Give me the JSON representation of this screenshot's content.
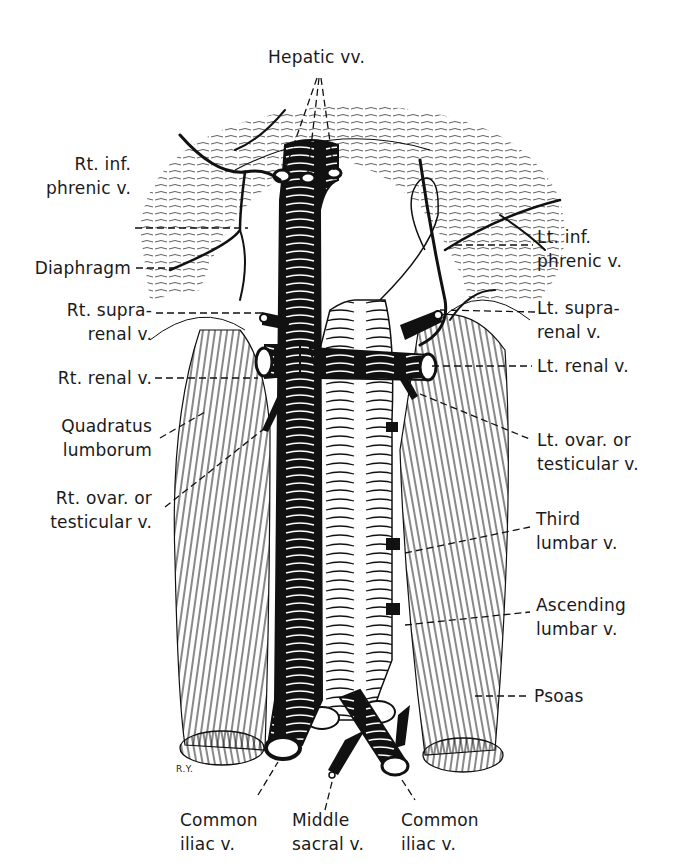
{
  "figure": {
    "artist_initials": "R.Y.",
    "colors": {
      "ink": "#111111",
      "paper": "#ffffff"
    }
  },
  "labels": {
    "hepatic_vv": {
      "lines": [
        "Hepatic vv."
      ]
    },
    "rt_inf_phrenic": {
      "lines": [
        "Rt. inf.",
        "phrenic v."
      ]
    },
    "diaphragm": {
      "lines": [
        "Diaphragm"
      ]
    },
    "rt_suprarenal": {
      "lines": [
        "Rt. supra-",
        "renal v."
      ]
    },
    "rt_renal": {
      "lines": [
        "Rt. renal v."
      ]
    },
    "quadratus_lumborum": {
      "lines": [
        "Quadratus",
        "lumborum"
      ]
    },
    "rt_ovar_testicular": {
      "lines": [
        "Rt. ovar. or",
        "testicular v."
      ]
    },
    "lt_inf_phrenic": {
      "lines": [
        "Lt. inf.",
        "phrenic v."
      ]
    },
    "lt_suprarenal": {
      "lines": [
        "Lt. supra-",
        "renal v."
      ]
    },
    "lt_renal": {
      "lines": [
        "Lt. renal v."
      ]
    },
    "lt_ovar_testicular": {
      "lines": [
        "Lt. ovar. or",
        "testicular v."
      ]
    },
    "third_lumbar": {
      "lines": [
        "Third",
        "lumbar v."
      ]
    },
    "ascending_lumbar": {
      "lines": [
        "Ascending",
        "lumbar v."
      ]
    },
    "psoas": {
      "lines": [
        "Psoas"
      ]
    },
    "rt_common_iliac": {
      "lines": [
        "Common",
        "iliac v."
      ]
    },
    "middle_sacral": {
      "lines": [
        "Middle",
        "sacral v."
      ]
    },
    "lt_common_iliac": {
      "lines": [
        "Common",
        "iliac v."
      ]
    }
  }
}
